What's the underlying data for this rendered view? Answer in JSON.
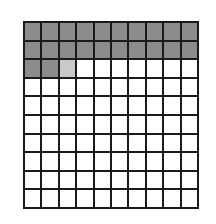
{
  "figure": {
    "type": "shaded-grid-diagram"
  },
  "grid": {
    "rows": 10,
    "columns": 10,
    "total_cells": 100,
    "shaded_cells_full": 22,
    "shaded_cells_partial": 1,
    "shaded_value": "2.5 rows",
    "unshaded_cells": 77
  },
  "colors": {
    "shaded_full": "#8c8c8c",
    "shaded_partial": "#c9c9c9",
    "unshaded": "#ffffff",
    "gridline": "#1a1a1a",
    "background": "#ffffff"
  },
  "chart_data": {
    "type": "heatmap",
    "title": "",
    "xlabel": "",
    "ylabel": "",
    "categories": [
      "1",
      "2",
      "3",
      "4",
      "5",
      "6",
      "7",
      "8",
      "9",
      "10"
    ],
    "row_labels": [
      "1",
      "2",
      "3",
      "4",
      "5",
      "6",
      "7",
      "8",
      "9",
      "10"
    ],
    "legend": [],
    "grid": true,
    "values": [
      [
        1,
        1,
        1,
        1,
        1,
        1,
        1,
        1,
        1,
        1
      ],
      [
        1,
        1,
        1,
        1,
        1,
        1,
        1,
        1,
        1,
        1
      ],
      [
        1,
        1,
        0.5,
        0,
        0,
        0,
        0,
        0,
        0,
        0
      ],
      [
        0,
        0,
        0,
        0,
        0,
        0,
        0,
        0,
        0,
        0
      ],
      [
        0,
        0,
        0,
        0,
        0,
        0,
        0,
        0,
        0,
        0
      ],
      [
        0,
        0,
        0,
        0,
        0,
        0,
        0,
        0,
        0,
        0
      ],
      [
        0,
        0,
        0,
        0,
        0,
        0,
        0,
        0,
        0,
        0
      ],
      [
        0,
        0,
        0,
        0,
        0,
        0,
        0,
        0,
        0,
        0
      ],
      [
        0,
        0,
        0,
        0,
        0,
        0,
        0,
        0,
        0,
        0
      ],
      [
        0,
        0,
        0,
        0,
        0,
        0,
        0,
        0,
        0,
        0
      ]
    ]
  }
}
